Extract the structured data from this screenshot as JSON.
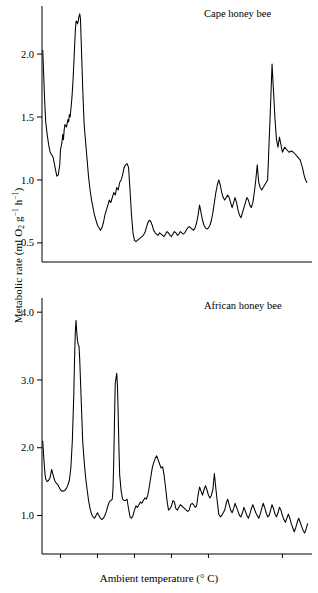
{
  "figure": {
    "y_axis_label_text": "Metabolic rate (ml O2 g-1 h-1)",
    "y_axis_label_parts": {
      "pre": "Metabolic rate (ml O",
      "sub": "2",
      "mid": " g",
      "sup1": "−1",
      "mid2": " h",
      "sup2": "−1",
      "post": ")"
    },
    "x_axis_label_parts": {
      "pre": "Ambient temperature (",
      "deg": "°",
      "post": " C)"
    }
  },
  "chart_data": [
    {
      "type": "line",
      "title": "Cape honey bee",
      "xlabel": "Ambient temperature (° C)",
      "ylabel": "Metabolic rate (ml O₂ g⁻¹ h⁻¹)",
      "xlim": [
        22.5,
        -14.0
      ],
      "ylim": [
        0.38,
        2.35
      ],
      "x_reversed": true,
      "xticks": [
        20,
        15,
        10,
        5,
        0,
        -10
      ],
      "xticklabels": [
        "20",
        "15",
        "10",
        "5",
        "0",
        "−10"
      ],
      "yticks": [
        0.5,
        1.0,
        1.5,
        2.0
      ],
      "yticklabels": [
        "0.5",
        "1.0",
        "1.5",
        "2.0"
      ],
      "grid": false,
      "legend": "none",
      "line_color": "#000000",
      "x": [
        22.4,
        22.3,
        22.2,
        22.1,
        22.0,
        21.8,
        21.6,
        21.4,
        21.2,
        21.0,
        20.8,
        20.6,
        20.5,
        20.3,
        20.1,
        20.0,
        19.8,
        19.7,
        19.6,
        19.5,
        19.4,
        19.2,
        19.0,
        18.9,
        18.8,
        18.7,
        18.6,
        18.5,
        18.4,
        18.3,
        18.2,
        18.1,
        18.0,
        17.9,
        17.8,
        17.7,
        17.6,
        17.5,
        17.4,
        17.3,
        17.2,
        17.1,
        17.0,
        16.9,
        16.8,
        16.6,
        16.4,
        16.2,
        16.0,
        15.8,
        15.6,
        15.4,
        15.2,
        15.0,
        14.8,
        14.6,
        14.4,
        14.2,
        14.0,
        13.8,
        13.6,
        13.4,
        13.2,
        13.0,
        12.8,
        12.6,
        12.4,
        12.2,
        12.0,
        11.8,
        11.6,
        11.4,
        11.2,
        11.0,
        10.8,
        10.6,
        10.4,
        10.2,
        10.0,
        9.8,
        9.6,
        9.4,
        9.2,
        9.0,
        8.8,
        8.6,
        8.4,
        8.2,
        8.0,
        7.8,
        7.6,
        7.4,
        7.2,
        7.0,
        6.8,
        6.6,
        6.4,
        6.2,
        6.0,
        5.8,
        5.6,
        5.4,
        5.2,
        5.0,
        4.8,
        4.6,
        4.4,
        4.2,
        4.0,
        3.8,
        3.6,
        3.4,
        3.2,
        3.0,
        2.8,
        2.6,
        2.4,
        2.2,
        2.0,
        1.8,
        1.6,
        1.4,
        1.2,
        1.0,
        0.8,
        0.6,
        0.4,
        0.2,
        0.0,
        -0.2,
        -0.4,
        -0.6,
        -0.8,
        -1.0,
        -1.2,
        -1.4,
        -1.6,
        -1.8,
        -2.0,
        -2.2,
        -2.4,
        -2.6,
        -2.8,
        -3.0,
        -3.2,
        -3.4,
        -3.6,
        -3.8,
        -4.0,
        -4.2,
        -4.4,
        -4.6,
        -4.8,
        -5.0,
        -5.2,
        -5.4,
        -5.6,
        -5.8,
        -6.0,
        -6.2,
        -6.4,
        -6.6,
        -6.8,
        -7.0,
        -7.2,
        -7.4,
        -7.6,
        -7.8,
        -8.0,
        -8.2,
        -8.4,
        -8.6,
        -8.8,
        -9.0,
        -9.2,
        -9.4,
        -9.6,
        -9.8,
        -10.0,
        -10.3,
        -10.6,
        -10.9,
        -11.2,
        -11.5,
        -11.8,
        -12.1,
        -12.4,
        -12.7,
        -13.0,
        -13.3
      ],
      "y": [
        2.03,
        1.88,
        1.72,
        1.58,
        1.46,
        1.36,
        1.28,
        1.22,
        1.2,
        1.18,
        1.12,
        1.06,
        1.03,
        1.04,
        1.12,
        1.24,
        1.3,
        1.36,
        1.32,
        1.4,
        1.44,
        1.42,
        1.48,
        1.46,
        1.52,
        1.5,
        1.56,
        1.62,
        1.7,
        1.8,
        1.92,
        2.05,
        2.18,
        2.26,
        2.26,
        2.24,
        2.26,
        2.3,
        2.32,
        2.28,
        2.1,
        1.92,
        1.74,
        1.58,
        1.44,
        1.3,
        1.16,
        1.02,
        0.92,
        0.84,
        0.78,
        0.72,
        0.68,
        0.64,
        0.62,
        0.6,
        0.62,
        0.66,
        0.72,
        0.76,
        0.8,
        0.84,
        0.82,
        0.86,
        0.9,
        0.88,
        0.94,
        0.92,
        0.98,
        1.0,
        1.04,
        1.1,
        1.12,
        1.13,
        1.1,
        0.92,
        0.72,
        0.58,
        0.52,
        0.51,
        0.52,
        0.53,
        0.54,
        0.55,
        0.56,
        0.58,
        0.62,
        0.66,
        0.68,
        0.67,
        0.64,
        0.6,
        0.58,
        0.57,
        0.56,
        0.58,
        0.57,
        0.56,
        0.55,
        0.57,
        0.59,
        0.58,
        0.56,
        0.55,
        0.57,
        0.59,
        0.58,
        0.56,
        0.57,
        0.59,
        0.58,
        0.57,
        0.58,
        0.6,
        0.62,
        0.63,
        0.62,
        0.61,
        0.6,
        0.62,
        0.66,
        0.72,
        0.8,
        0.74,
        0.68,
        0.64,
        0.62,
        0.61,
        0.62,
        0.64,
        0.68,
        0.74,
        0.82,
        0.9,
        0.96,
        1.0,
        0.96,
        0.9,
        0.86,
        0.84,
        0.86,
        0.88,
        0.86,
        0.82,
        0.78,
        0.82,
        0.86,
        0.82,
        0.76,
        0.72,
        0.7,
        0.74,
        0.78,
        0.82,
        0.86,
        0.84,
        0.8,
        0.78,
        0.82,
        0.9,
        1.0,
        1.12,
        0.98,
        0.94,
        0.92,
        0.94,
        0.96,
        0.98,
        1.0,
        1.3,
        1.6,
        1.92,
        1.7,
        1.48,
        1.32,
        1.26,
        1.34,
        1.28,
        1.22,
        1.26,
        1.24,
        1.22,
        1.23,
        1.22,
        1.2,
        1.18,
        1.16,
        1.1,
        1.02,
        0.98,
        1.06,
        1.12,
        1.06,
        1.1,
        1.04,
        1.12,
        1.18,
        1.16,
        1.18
      ]
    },
    {
      "type": "line",
      "title": "African honey bee",
      "xlabel": "Ambient temperature (° C)",
      "ylabel": "Metabolic rate (ml O₂ g⁻¹ h⁻¹)",
      "xlim": [
        22.5,
        -14.0
      ],
      "ylim": [
        0.55,
        4.15
      ],
      "x_reversed": true,
      "xticks": [
        20,
        15,
        10,
        5,
        0,
        -10
      ],
      "xticklabels": [
        "20",
        "15",
        "10",
        "5",
        "0",
        "−10"
      ],
      "yticks": [
        1.0,
        2.0,
        3.0,
        4.0
      ],
      "yticklabels": [
        "1.0",
        "2.0",
        "3.0",
        "4.0"
      ],
      "grid": false,
      "legend": "none",
      "line_color": "#000000",
      "x": [
        22.4,
        22.3,
        22.2,
        22.1,
        22.0,
        21.8,
        21.6,
        21.4,
        21.2,
        21.0,
        20.8,
        20.6,
        20.4,
        20.2,
        20.0,
        19.8,
        19.6,
        19.4,
        19.2,
        19.0,
        18.8,
        18.6,
        18.4,
        18.2,
        18.1,
        18.0,
        17.9,
        17.8,
        17.7,
        17.6,
        17.5,
        17.4,
        17.3,
        17.2,
        17.1,
        17.0,
        16.8,
        16.6,
        16.4,
        16.2,
        16.0,
        15.8,
        15.6,
        15.4,
        15.2,
        15.0,
        14.8,
        14.6,
        14.4,
        14.2,
        14.0,
        13.8,
        13.6,
        13.4,
        13.2,
        13.0,
        12.9,
        12.8,
        12.7,
        12.6,
        12.5,
        12.4,
        12.3,
        12.2,
        12.1,
        12.0,
        11.8,
        11.6,
        11.4,
        11.2,
        11.0,
        10.8,
        10.6,
        10.4,
        10.2,
        10.0,
        9.8,
        9.6,
        9.4,
        9.2,
        9.0,
        8.8,
        8.6,
        8.4,
        8.2,
        8.0,
        7.8,
        7.6,
        7.4,
        7.2,
        7.0,
        6.8,
        6.6,
        6.4,
        6.2,
        6.0,
        5.8,
        5.6,
        5.4,
        5.2,
        5.0,
        4.8,
        4.6,
        4.4,
        4.2,
        4.0,
        3.8,
        3.6,
        3.4,
        3.2,
        3.0,
        2.8,
        2.6,
        2.4,
        2.2,
        2.0,
        1.8,
        1.6,
        1.4,
        1.2,
        1.0,
        0.8,
        0.6,
        0.4,
        0.2,
        0.0,
        -0.2,
        -0.4,
        -0.6,
        -0.8,
        -1.0,
        -1.2,
        -1.4,
        -1.6,
        -1.8,
        -2.0,
        -2.2,
        -2.4,
        -2.6,
        -2.8,
        -3.0,
        -3.2,
        -3.4,
        -3.6,
        -3.8,
        -4.0,
        -4.2,
        -4.4,
        -4.6,
        -4.8,
        -5.0,
        -5.2,
        -5.4,
        -5.6,
        -5.8,
        -6.0,
        -6.2,
        -6.4,
        -6.6,
        -6.8,
        -7.0,
        -7.2,
        -7.4,
        -7.6,
        -7.8,
        -8.0,
        -8.2,
        -8.4,
        -8.6,
        -8.8,
        -9.0,
        -9.2,
        -9.4,
        -9.6,
        -9.8,
        -10.0,
        -10.2,
        -10.4,
        -10.6,
        -10.8,
        -11.0,
        -11.2,
        -11.4,
        -11.6,
        -11.8,
        -12.0,
        -12.2,
        -12.4,
        -12.6,
        -12.8,
        -13.0,
        -13.2,
        -13.4
      ],
      "y": [
        2.1,
        1.92,
        1.76,
        1.62,
        1.54,
        1.5,
        1.52,
        1.56,
        1.68,
        1.6,
        1.52,
        1.48,
        1.46,
        1.42,
        1.38,
        1.36,
        1.36,
        1.37,
        1.4,
        1.45,
        1.52,
        1.7,
        2.1,
        2.8,
        3.3,
        3.7,
        3.88,
        3.7,
        3.58,
        3.52,
        3.5,
        3.3,
        3.0,
        2.7,
        2.4,
        2.1,
        1.8,
        1.56,
        1.38,
        1.22,
        1.1,
        1.02,
        0.98,
        0.96,
        1.0,
        1.04,
        1.0,
        0.96,
        0.94,
        0.96,
        1.0,
        1.06,
        1.14,
        1.2,
        1.22,
        1.24,
        1.4,
        1.8,
        2.4,
        2.95,
        3.02,
        3.1,
        2.92,
        2.5,
        2.0,
        1.6,
        1.36,
        1.24,
        1.22,
        1.22,
        1.24,
        1.1,
        0.98,
        0.96,
        1.0,
        1.08,
        1.14,
        1.12,
        1.16,
        1.2,
        1.18,
        1.22,
        1.26,
        1.24,
        1.3,
        1.42,
        1.56,
        1.7,
        1.78,
        1.84,
        1.88,
        1.82,
        1.76,
        1.7,
        1.72,
        1.6,
        1.42,
        1.22,
        1.08,
        1.1,
        1.14,
        1.22,
        1.2,
        1.1,
        1.08,
        1.12,
        1.16,
        1.14,
        1.12,
        1.1,
        1.08,
        1.06,
        1.08,
        1.16,
        1.18,
        1.16,
        1.12,
        1.14,
        1.3,
        1.42,
        1.36,
        1.3,
        1.38,
        1.44,
        1.38,
        1.3,
        1.26,
        1.3,
        1.38,
        1.62,
        1.4,
        1.2,
        1.02,
        0.98,
        1.0,
        1.04,
        1.08,
        1.18,
        1.24,
        1.16,
        1.08,
        1.04,
        1.1,
        1.18,
        1.12,
        1.06,
        1.0,
        0.98,
        1.04,
        1.12,
        1.06,
        1.0,
        0.96,
        1.02,
        1.1,
        1.16,
        1.1,
        1.04,
        1.0,
        0.96,
        1.02,
        1.1,
        1.18,
        1.12,
        1.04,
        0.98,
        1.0,
        1.08,
        1.16,
        1.1,
        1.02,
        0.98,
        1.04,
        1.12,
        1.08,
        1.0,
        0.94,
        0.9,
        0.96,
        1.02,
        0.96,
        0.88,
        0.82,
        0.76,
        0.82,
        0.9,
        0.96,
        0.9,
        0.84,
        0.78,
        0.74,
        0.8,
        0.88,
        0.94,
        0.86,
        0.78,
        0.72
      ]
    }
  ]
}
